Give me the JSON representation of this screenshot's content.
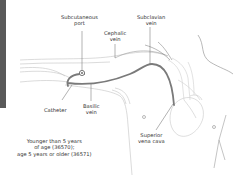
{
  "diagram": {
    "type": "anatomical illustration",
    "labels": {
      "subcutaneous_port": [
        "Subcutaneous",
        "port"
      ],
      "subclavian_vein": [
        "Subclavian",
        "vein"
      ],
      "cephalic_vein": [
        "Cephalic",
        "vein"
      ],
      "catheter": [
        "Catheter"
      ],
      "basilic_vein": [
        "Basilic",
        "vein"
      ],
      "superior_vena_cava": [
        "Superior",
        "vena cava"
      ]
    },
    "caption": [
      "Younger than 5 years",
      "of age (36570);",
      "age  5 years or older (36571)"
    ]
  },
  "colors": {
    "sidebar": "#595959",
    "catheter": "#7a7a7a",
    "outline": "#b5b5b5",
    "leader": "#666666",
    "text": "#333333"
  }
}
